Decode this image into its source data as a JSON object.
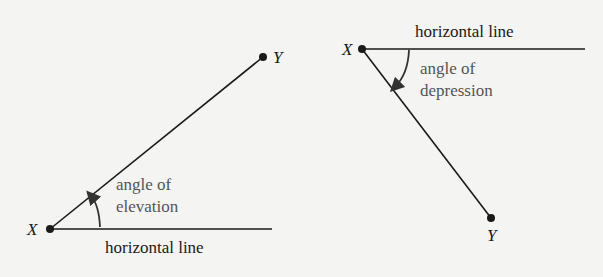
{
  "left_diagram": {
    "title": "angle of elevation",
    "point_x_label": "X",
    "point_y_label": "Y",
    "angle_label_line1": "angle of",
    "angle_label_line2": "elevation",
    "horizontal_label": "horizontal line"
  },
  "right_diagram": {
    "title": "angle of depression",
    "point_x_label": "X",
    "point_y_label": "Y",
    "angle_label_line1": "angle of",
    "angle_label_line2": "depression",
    "horizontal_label": "horizontal line"
  },
  "colors": {
    "background": "#f4f4f2",
    "line": "#1a1a1a",
    "angle_text": "#555555"
  }
}
